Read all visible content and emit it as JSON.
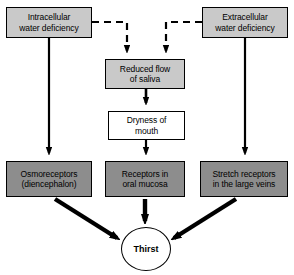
{
  "diagram": {
    "colors": {
      "box_light_gray": "#c9c9c9",
      "box_dark_gray": "#8d8d8d",
      "box_white": "#ffffff",
      "stroke": "#000000",
      "background": "#ffffff"
    },
    "nodes": {
      "intracellular": {
        "line1": "Intracellular",
        "line2": "water deficiency",
        "fill": "light-gray",
        "shape": "rect"
      },
      "extracellular": {
        "line1": "Extracellular",
        "line2": "water deficiency",
        "fill": "light-gray",
        "shape": "rect"
      },
      "saliva": {
        "line1": "Reduced flow",
        "line2": "of saliva",
        "fill": "light-gray",
        "shape": "rect"
      },
      "dryness": {
        "line1": "Dryness of",
        "line2": "mouth",
        "fill": "white",
        "shape": "rect"
      },
      "osmoreceptors": {
        "line1": "Osmoreceptors",
        "line2": "(diencephalon)",
        "fill": "dark-gray",
        "shape": "rect"
      },
      "oral_receptors": {
        "line1": "Receptors in",
        "line2": "oral mucosa",
        "fill": "dark-gray",
        "shape": "rect"
      },
      "stretch_receptors": {
        "line1": "Stretch receptors",
        "line2": "in the large veins",
        "fill": "dark-gray",
        "shape": "rect"
      },
      "thirst": {
        "label": "Thirst",
        "fill": "white",
        "shape": "ellipse"
      }
    },
    "edges": [
      {
        "from": "intracellular",
        "to": "saliva",
        "style": "dashed",
        "arrow": "solid-head"
      },
      {
        "from": "extracellular",
        "to": "saliva",
        "style": "dashed",
        "arrow": "solid-head"
      },
      {
        "from": "intracellular",
        "to": "osmoreceptors",
        "style": "solid",
        "arrow": "solid-head"
      },
      {
        "from": "extracellular",
        "to": "stretch_receptors",
        "style": "solid",
        "arrow": "solid-head"
      },
      {
        "from": "saliva",
        "to": "dryness",
        "style": "solid",
        "arrow": "solid-head"
      },
      {
        "from": "dryness",
        "to": "oral_receptors",
        "style": "solid",
        "arrow": "solid-head"
      },
      {
        "from": "osmoreceptors",
        "to": "thirst",
        "style": "solid-thick",
        "arrow": "solid-head"
      },
      {
        "from": "oral_receptors",
        "to": "thirst",
        "style": "solid-thick",
        "arrow": "solid-head"
      },
      {
        "from": "stretch_receptors",
        "to": "thirst",
        "style": "solid-thick",
        "arrow": "solid-head"
      }
    ]
  }
}
